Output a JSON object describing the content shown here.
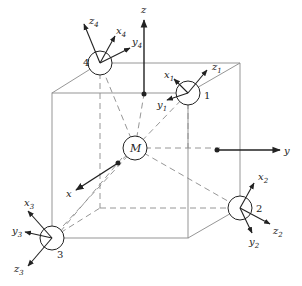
{
  "diagram": {
    "center_label": "M",
    "global_axes": {
      "x": "x",
      "y": "y",
      "z": "z"
    },
    "nodes": [
      {
        "id": "1",
        "axes": {
          "x": "x",
          "x_sub": "1",
          "y": "y",
          "y_sub": "1",
          "z": "z",
          "z_sub": "1"
        }
      },
      {
        "id": "2",
        "axes": {
          "x": "x",
          "x_sub": "2",
          "y": "y",
          "y_sub": "2",
          "z": "z",
          "z_sub": "2"
        }
      },
      {
        "id": "3",
        "axes": {
          "x": "x",
          "x_sub": "3",
          "y": "y",
          "y_sub": "3",
          "z": "z",
          "z_sub": "3"
        }
      },
      {
        "id": "4",
        "axes": {
          "x": "x",
          "x_sub": "4",
          "y": "y",
          "y_sub": "4",
          "z": "z",
          "z_sub": "4"
        }
      }
    ],
    "colors": {
      "line": "#222222",
      "edge": "#888888",
      "background": "#ffffff"
    }
  }
}
